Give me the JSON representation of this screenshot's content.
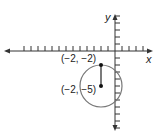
{
  "diagram": {
    "type": "coordinate-plane-circle",
    "axes": {
      "x_label": "x",
      "y_label": "y",
      "origin_px": [
        115,
        51
      ],
      "unit_px": 7,
      "x_ticks_left": 13,
      "x_ticks_right": 4,
      "y_ticks_up": 5,
      "y_ticks_down": 11
    },
    "circle": {
      "center": [
        -2,
        -5
      ],
      "radius": 3,
      "stroke": "#777777"
    },
    "points": [
      {
        "coords": [
          -2,
          -2
        ],
        "label": "(−2, −2)"
      },
      {
        "coords": [
          -2,
          -5
        ],
        "label": "(−2, −5)"
      }
    ],
    "segment": {
      "from": [
        -2,
        -2
      ],
      "to": [
        -2,
        -5
      ],
      "meaning": "radius"
    }
  }
}
